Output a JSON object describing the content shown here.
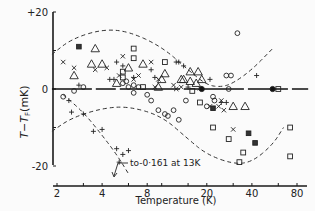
{
  "chart_data": {
    "type": "scatter",
    "title": "",
    "xlabel": "Temperature  (K)",
    "ylabel": "T - T_F (mK)",
    "xscale": "log",
    "xlim": [
      1.85,
      95
    ],
    "ylim": [
      -22,
      22
    ],
    "x_ticks": [
      2,
      3,
      4,
      6,
      8,
      10,
      15,
      20,
      30,
      40,
      60,
      80
    ],
    "x_tick_labels": [
      "2",
      "4",
      "8",
      "20",
      "40",
      "80"
    ],
    "x_tick_label_values": [
      2,
      4,
      8,
      20,
      40,
      80
    ],
    "y_ticks": [
      -20,
      -10,
      0,
      10,
      20
    ],
    "y_tick_labels": [
      "+20",
      "0",
      "-20"
    ],
    "y_tick_label_values": [
      20,
      0,
      -20
    ],
    "grid": false,
    "legend": null,
    "annotation": {
      "text": "to-0·161 at 13K",
      "x": 6.5,
      "y": -20
    },
    "series": [
      {
        "name": "triangles",
        "marker": "triangle",
        "points": [
          [
            3.6,
            10.5
          ],
          [
            4.0,
            6.5
          ],
          [
            3.4,
            6.5
          ],
          [
            2.6,
            3.5
          ],
          [
            6.0,
            5.5
          ],
          [
            7.5,
            6.5
          ],
          [
            5.0,
            1.5
          ],
          [
            10.5,
            4.0
          ],
          [
            10.0,
            2.5
          ],
          [
            13.5,
            2.5
          ],
          [
            15.5,
            4.5
          ],
          [
            17.5,
            4.5
          ],
          [
            18.5,
            2.5
          ],
          [
            9.5,
            0.5
          ],
          [
            17.0,
            1.5
          ],
          [
            14.0,
            2.5
          ],
          [
            30.0,
            -4.5
          ],
          [
            36.0,
            -4.5
          ],
          [
            15.5,
            2.0
          ]
        ]
      },
      {
        "name": "crosses",
        "marker": "x",
        "points": [
          [
            2.2,
            7.0
          ],
          [
            2.6,
            5.5
          ],
          [
            3.6,
            5.0
          ],
          [
            4.3,
            5.5
          ],
          [
            5.5,
            8.5
          ],
          [
            5.2,
            3.5
          ],
          [
            7.0,
            3.5
          ],
          [
            8.5,
            7.0
          ],
          [
            6.5,
            2.5
          ],
          [
            9.5,
            2.5
          ],
          [
            9.0,
            0.5
          ],
          [
            12.0,
            1.0
          ],
          [
            12.5,
            0.0
          ],
          [
            13.5,
            0.5
          ],
          [
            18.0,
            0.2
          ],
          [
            21.0,
            -4.5
          ],
          [
            24.0,
            -4.5
          ],
          [
            26.0,
            -5.5
          ],
          [
            30.0,
            -10.5
          ],
          [
            25.0,
            -3.0
          ]
        ]
      },
      {
        "name": "plus",
        "marker": "+",
        "points": [
          [
            5.0,
            7.0
          ],
          [
            5.5,
            6.0
          ],
          [
            4.5,
            2.5
          ],
          [
            4.8,
            2.5
          ],
          [
            8.5,
            5.0
          ],
          [
            9.0,
            3.0
          ],
          [
            6.5,
            3.0
          ],
          [
            2.8,
            1.0
          ],
          [
            2.4,
            -3.0
          ],
          [
            2.5,
            -6.0
          ],
          [
            3.0,
            -6.5
          ],
          [
            3.5,
            -11.0
          ],
          [
            4.0,
            -10.5
          ],
          [
            5.0,
            -15.5
          ],
          [
            5.5,
            -17.0
          ],
          [
            6.0,
            -16.0
          ],
          [
            5.2,
            -19.0
          ],
          [
            12.5,
            7.0
          ],
          [
            13.0,
            7.0
          ],
          [
            14.0,
            6.0
          ],
          [
            15.0,
            0.5
          ],
          [
            21.0,
            2.5
          ],
          [
            25.0,
            -3.5
          ],
          [
            27.0,
            -3.5
          ],
          [
            43.0,
            3.5
          ]
        ]
      },
      {
        "name": "open circles",
        "marker": "circle",
        "points": [
          [
            2.6,
            -0.5
          ],
          [
            3.0,
            0.5
          ],
          [
            5.5,
            1.5
          ],
          [
            5.8,
            2.0
          ],
          [
            6.0,
            0.5
          ],
          [
            6.5,
            1.0
          ],
          [
            7.0,
            0.5
          ],
          [
            6.5,
            -1.0
          ],
          [
            8.0,
            -1.5
          ],
          [
            8.5,
            -3.0
          ],
          [
            9.5,
            -5.5
          ],
          [
            10.5,
            -6.5
          ],
          [
            11.0,
            -7.0
          ],
          [
            2.2,
            -2.0
          ],
          [
            13.0,
            -8.0
          ],
          [
            12.0,
            -5.5
          ],
          [
            14.5,
            -3.0
          ],
          [
            20.0,
            -4.5
          ],
          [
            22.0,
            -2.0
          ],
          [
            28.0,
            0.0
          ],
          [
            22.5,
            -3.0
          ],
          [
            27.0,
            3.5
          ],
          [
            29.0,
            3.5
          ],
          [
            32.0,
            14.5
          ]
        ]
      },
      {
        "name": "open squares",
        "marker": "square",
        "points": [
          [
            6.5,
            10.5
          ],
          [
            6.5,
            8.0
          ],
          [
            5.5,
            4.5
          ],
          [
            5.5,
            3.0
          ],
          [
            10.5,
            7.0
          ],
          [
            7.5,
            0.5
          ],
          [
            16.0,
            -0.5
          ],
          [
            22.0,
            -10.0
          ],
          [
            28.0,
            -13.0
          ],
          [
            35.0,
            -16.5
          ],
          [
            33.0,
            -19.0
          ],
          [
            60.0,
            0.0
          ],
          [
            72.0,
            -10.0
          ],
          [
            72.0,
            -17.5
          ],
          [
            18.0,
            -3.5
          ]
        ]
      },
      {
        "name": "filled circles",
        "marker": "filled-circle",
        "points": [
          [
            18.5,
            0.0
          ],
          [
            55.0,
            0.0
          ]
        ]
      },
      {
        "name": "filled squares",
        "marker": "filled-square",
        "points": [
          [
            2.8,
            11.0
          ],
          [
            22.0,
            -5.0
          ],
          [
            42.0,
            -14.0
          ],
          [
            38.0,
            -11.5
          ]
        ]
      }
    ],
    "curves": [
      {
        "name": "upper error envelope",
        "style": "dashed",
        "points": [
          [
            1.85,
            9.0
          ],
          [
            2.5,
            13.0
          ],
          [
            4.0,
            15.5
          ],
          [
            6.0,
            15.0
          ],
          [
            10.0,
            11.0
          ],
          [
            15.0,
            5.0
          ],
          [
            20.0,
            1.0
          ],
          [
            25.0,
            0.5
          ],
          [
            30.0,
            1.5
          ],
          [
            40.0,
            5.0
          ],
          [
            55.0,
            10.5
          ]
        ]
      },
      {
        "name": "lower error envelope",
        "style": "dashed",
        "points": [
          [
            1.85,
            -11.0
          ],
          [
            2.5,
            -7.5
          ],
          [
            4.0,
            -5.0
          ],
          [
            6.0,
            -4.5
          ],
          [
            10.0,
            -7.0
          ],
          [
            15.0,
            -13.0
          ],
          [
            20.0,
            -17.0
          ],
          [
            30.0,
            -19.5
          ],
          [
            40.0,
            -19.0
          ],
          [
            55.0,
            -14.5
          ],
          [
            65.0,
            -10.0
          ]
        ]
      },
      {
        "name": "steep lower branch",
        "style": "dashed",
        "points": [
          [
            2.2,
            -1.5
          ],
          [
            3.0,
            -6.0
          ],
          [
            4.0,
            -12.0
          ],
          [
            5.0,
            -17.0
          ],
          [
            6.0,
            -22.0
          ]
        ]
      },
      {
        "name": "zero baseline",
        "style": "solid-segments",
        "points": [
          [
            1.85,
            0.0
          ],
          [
            95.0,
            0.0
          ]
        ]
      }
    ]
  }
}
